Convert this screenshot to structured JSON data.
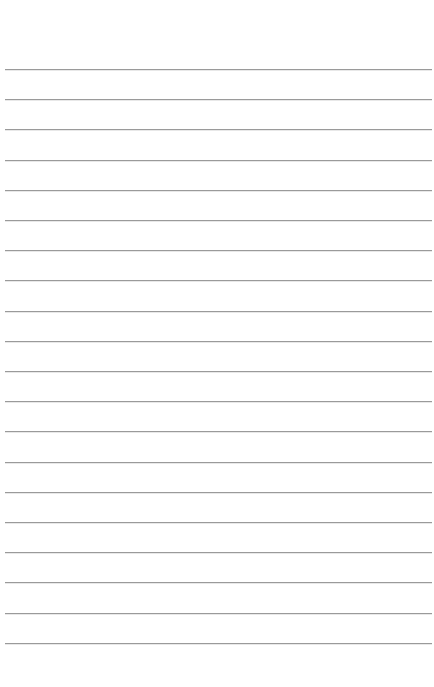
{
  "page": {
    "type": "lined-paper",
    "line_count": 20,
    "first_line_y": 69,
    "line_spacing": 30.2,
    "line_left": 5,
    "line_right": 432,
    "line_color": "#9a9a9a",
    "background_color": "#ffffff"
  }
}
